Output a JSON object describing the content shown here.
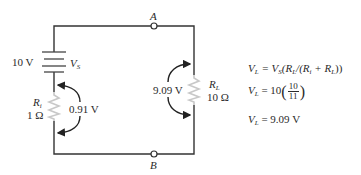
{
  "circuit": {
    "nodes": {
      "a": "A",
      "b": "B"
    },
    "source": {
      "value": "10 V",
      "symbol": "V",
      "symbol_sub": "S"
    },
    "internal_resistor": {
      "symbol": "R",
      "symbol_sub": "i",
      "value": "1 Ω",
      "voltage": "0.91 V"
    },
    "load_resistor": {
      "symbol": "R",
      "symbol_sub": "L",
      "value": "10 Ω",
      "voltage": "9.09 V"
    }
  },
  "equations": {
    "line1": {
      "lhs": "V",
      "lhs_sub": "L",
      "rhs_a": " = V",
      "rhs_a_sub": "S",
      "rhs_b": "(R",
      "rhs_b_sub": "L",
      "rhs_c": "/(R",
      "rhs_c_sub": "i",
      "rhs_d": " + R",
      "rhs_d_sub": "L",
      "rhs_e": "))"
    },
    "line2": {
      "lhs": "V",
      "lhs_sub": "L",
      "rhs": " = 10",
      "num": "10",
      "den": "11"
    },
    "line3": {
      "lhs": "V",
      "lhs_sub": "L",
      "rhs": " = 9.09 V"
    }
  },
  "colors": {
    "wire": "#333333",
    "resistor": "#c8c8c8",
    "arrow": "#222222"
  }
}
